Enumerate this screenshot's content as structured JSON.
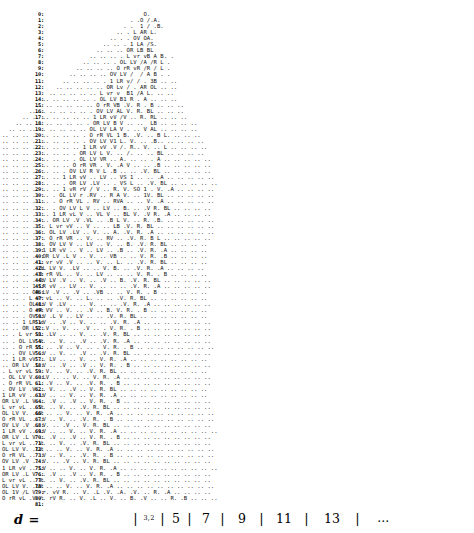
{
  "figure": {
    "kind": "ascii-character-scatter-plot",
    "width": 474,
    "height": 533,
    "ink_color": "#111111",
    "background_color": "#ffffff"
  },
  "y_axis": {
    "name": "row-index",
    "min": 0,
    "max": 81,
    "suffix": ":",
    "labels": [
      "0:",
      "1:",
      "2:",
      "3:",
      "4:",
      "5:",
      "6:",
      "7:",
      "8:",
      "9:",
      "10:",
      "11:",
      "12:",
      "13:",
      "14:",
      "15:",
      "16:",
      "17:",
      "18:",
      "19:",
      "20:",
      "21:",
      "22:",
      "23:",
      "24:",
      "25:",
      "26:",
      "27:",
      "28:",
      "29:",
      "30:",
      "31:",
      "32:",
      "33:",
      "34:",
      "35:",
      "36:",
      "37:",
      "38:",
      "39:",
      "40:",
      "41:",
      "42:",
      "43:",
      "44:",
      "45:",
      "46:",
      "47:",
      "48:",
      "49:",
      "50:",
      "51:",
      "52:",
      "53:",
      "54:",
      "55:",
      "56:",
      "57:",
      "58:",
      "59:",
      "60:",
      "61:",
      "62:",
      "63:",
      "64:",
      "65:",
      "66:",
      "67:",
      "68:",
      "69:",
      "70:",
      "71:",
      "72:",
      "73:",
      "74:",
      "75:",
      "76:",
      "77:",
      "78:",
      "79:",
      "80:",
      "81:"
    ]
  },
  "x_axis": {
    "label": "d =",
    "ticks": [
      "3,2",
      "5",
      "7",
      "9",
      "11",
      "13",
      "…"
    ],
    "separator": "|"
  },
  "chart_data": {
    "type": "scatter",
    "title": "",
    "xlabel": "d =",
    "ylabel": "",
    "xlim": [
      3,
      15
    ],
    "ylim": [
      0,
      81
    ],
    "grid": true,
    "legend": null,
    "tick_labels_x": [
      "3,2",
      "5",
      "7",
      "9",
      "11",
      "13",
      "…"
    ],
    "tick_labels_y": [
      "0",
      "81"
    ],
    "glyph_alphabet": [
      "O",
      "A",
      "B",
      "L",
      "V",
      "R",
      "1",
      "0",
      "/",
      ".",
      "r"
    ],
    "rows": [
      "                                          O.",
      "                                      . .O /.A.",
      "                                    . .  1 / .B.",
      "                                  .. . L AR L.",
      "                                .. . . OV OA.",
      "                              .. .. . 1 LA /S.",
      "                            .. .. .. OR LB BL",
      "                          .. .. .. . L vr vB A B. .",
      "                        .. .. .. . OL LV /A /R L .",
      "                      .. .. .. .. O rR vR /R / L .",
      "                    .. .. .. .. OV LV /  / A B . .",
      "                  .. .. .. .. . 1 LR v/ / . 3B .. ..",
      "                .. .. .. .. .. OR Lv / . AR OL .. ..",
      "              .. .. .. .. .. L vr v  B1 /A L. .. ..",
      "            .. .. .. .. .. . OL LV B1 R . A .. .. ..",
      "          .. .. .. .. .. .. O rR VB .V. R . B .. .. ..",
      "        .. .. .. .. .. .. . OV LV AL V. R. BL .. .. ..",
      "      .. .. .. .. .. .. .. 1 LR vV /V .. R. RL .. .. ..",
      "    .. .. .. .. .. .. .. . OR LV B V .. ..  LB .. .. .. ..",
      "  .. .. .. .. .. .. .. .. OL LV LA V . .. V AL .. .. .. ..",
      ".. .. .. .. .. .. .. .. . O rR VL 1 B. .V. .. B L. .. .. ..",
      ".. .. .. .. .. .. .. .. . OV LV V1 L. V. .. .B.. .. .. .. ..",
      ".. .. .. .. .. .. .. .. 1 LR vV .V /. R.. V. .. L .. .. .. ..",
      ".. .. .. .. .. .. .. . OR LV L V. .. /. .. .. BL .. .. .. ..",
      ".. .. .. .. .. .. .. . OL LV VR .. A. .. .. . A .. .. .. .. ..",
      ".. .. .. .. .. .. .. O rR VR . V. .A V .. .. .B .. .. .. .. ..",
      ".. .. .. .. .. .. . OV LV R V L .B .. .. .V. BL .. .. .. .. ..",
      ".. .. .. .. .. .. 1 LR vV .. LV .. VS 1 .. .. .A .. .. .. .. ..",
      ".. .. .. .. .. .. . OR LV .LV .. . VS L .. .V. BL .. .. .. .. ..",
      ".. .. .. .. .. .. 1 vR rV / V .. R. V. SO 1 . V. .A .. .. .. ..",
      ".. .. .. .. .. . OL LV r .RV .. R A V. .. 1V. BL .. .. .. .. ..",
      ".. .. .. .. .. . O rR VL . RV .. RVA .. .. V. .A .. .. .. .. ..",
      ".. .. .. .. .. . OV LV L V .. LV .. B. .. .V R. BL .. .. .. ..",
      ".. .. .. .. .. 1 LR vL V .. VL V .. BL V. .V R. .A .. .. .. ..",
      ".. .. .. .. .. OR LV .V .VL .. .B L V. .. R. .B. .. .. .. .. ..",
      ".. .. .. .. . L vr vV .. V .. .. LB .V. R. BL .. .. .. .. .. ..",
      ".. .. .. .. . OL LV .LV .. V. .. A. .V. R. .A .. .. .. .. .. ..",
      ".. .. .. .. . O rR VR .. V. .. RV .. .V. R. B L .. .. .. .. ..",
      ".. .. .. .. . OV LV V .. LV .. V. .. B. .V. R. BL .. .. .. ..",
      ".. .. .. .. 1 LR vV .. V .. LV .. .B .. .V. R. .A .. .. .. ..",
      ".. .. .. .. OR LV .L V .. V. .. VB .. .. V. R. .B .. .. .. ..",
      ".. .. .. . L vr vV .V .. .. V. .. L. .. .V. R. BL .. .. .. ..",
      ".. .. .. . OL LV V. .LV .. .. V. B. .. .V. R. .A .. .. .. ..",
      ".. .. .. . O rR VL .. V. .. LV .. .. .. V. R. . B .. .. .. ..",
      ".. .. .. . OV LV .V .. V. .. .V .. B. .V. R. BL .. .. .. .. ..",
      ".. .. .. 1 LR vV .. LV .. V. .. .. .. .V. R. .A .. .. .. .. ..",
      ".. .. .. OR LV .V .. .V .. .VB .. .. V. R. . B .. .. .. .. ..",
      ".. .. . L vr vL .. V. .. L. .. .. .V. R. BL .. .. .. .. .. ..",
      ".. .. . OL LV V .LV .. .. V. .. .. .V. R. .A .. .. .. .. .. ..",
      ".. .. . O rR VV .. V. .. .V .. B. V. R. . B .. .. .. .. .. ..",
      ".. .. . OV LV .L V .. LV .. .. .V. R. BL .. .. .. .. .. .. ..",
      ".. .. 1 LR vV .. .V .. V. .. .. .V. R. .A .. .. .. .. .. .. ..",
      ".. .. OR LV .V .. V. .. .V .. . V. R. . B .. .. .. .. .. .. ..",
      ".. . L vr vL .LV .. .. V. .. .V. R. BL .. .. .. .. .. .. .. ..",
      ".. . OL LV V. .. V. .. .V .. .V. R. .A .. .. .. .. .. .. .. ..",
      ".. . O rR VL .. .V .. V. .. . V. R. . B .. .. .. .. .. .. .. ..",
      ".. . OV LV .V .. V. .. .V .. .V. R. BL .. .. .. .. .. .. .. ..",
      ".. 1 LR vV .. LV .. .. V. .. V. R. .A .. .. .. .. .. .. .. ..",
      ".. OR LV .L V .. .V .. .V .. V. R. . B .. .. .. .. .. .. .. ..",
      ". L vr vL .. V. .. V. .. .V. R. BL .. .. .. .. .. .. .. .. ..",
      ". OL LV V. .LV .. .. V. .. V. R. .A .. .. .. .. .. .. .. .. ..",
      ". O rR VL .. .V .. V. .. .V. R. . B .. .. .. .. .. .. .. .. ..",
      ". OV LV .V .. V. .. .V .. V. R. BL .. .. .. .. .. .. .. .. ..",
      "1 LR vV .. LV .. .. V. .. V. R. .A .. .. .. .. .. .. .. .. ..",
      "OR LV .L V .. .V .. .V .. V. R. . B .. .. .. .. .. .. .. .. ..",
      "L vr vL .. V. .. V. .. .V. R. BL .. .. .. .. .. .. .. .. .. ..",
      "OL LV V. .LV .. .. V. .. V. R. .A .. .. .. .. .. .. .. .. .. ..",
      "O rR VL .. .V .. V. .. .V. R. . B .. .. .. .. .. .. .. .. .. ..",
      "OV LV .V .. V. .. .V .. V. R. BL .. .. .. .. .. .. .. .. .. ..",
      "1 LR vV .. LV .. .. V. .. V. R. .A .. .. .. .. .. .. .. .. .. ..",
      "OR LV .L V .. .V .. .V .. V. R. . B .. .. .. .. .. .. .. .. ..",
      "L vr vL .. V. .. V. .. .V. R. BL .. .. .. .. .. .. .. .. .. ..",
      "OL LV V. .LV .. .. V. .. V. R. .A .. .. .. .. .. .. .. .. .. ..",
      "O rR VL .. .V .. V. .. .V. R. . B .. .. .. .. .. .. .. .. .. ..",
      "OV LV .V .. V. .. .V .. V. R. BL .. .. .. .. .. .. .. .. .. ..",
      "1 LR vV .. LV .. .. V. .. V. R. .A .. .. .. .. .. .. .. .. .. ..",
      "OR LV .L V .. .V .. .V .. V. R. . B .. .. .. .. .. .. .. .. ..",
      "L vr vL .. V. .. V. .. .V. R. BL .. .. .. .. .. .. .. .. .. ..",
      "OL LV V. .LV .. .. V. .. V. R. .A .. .. .. .. .. .. .. .. .. ..",
      "OL 1V /L V. r. vV R. .. V. .L .V. .A. .V. .. R. .A .. .. .. ..",
      "O rR vL .V /. rV R. .. V. .L .. V. .. B. .V .. .. R. .B .. .. .."
    ]
  }
}
